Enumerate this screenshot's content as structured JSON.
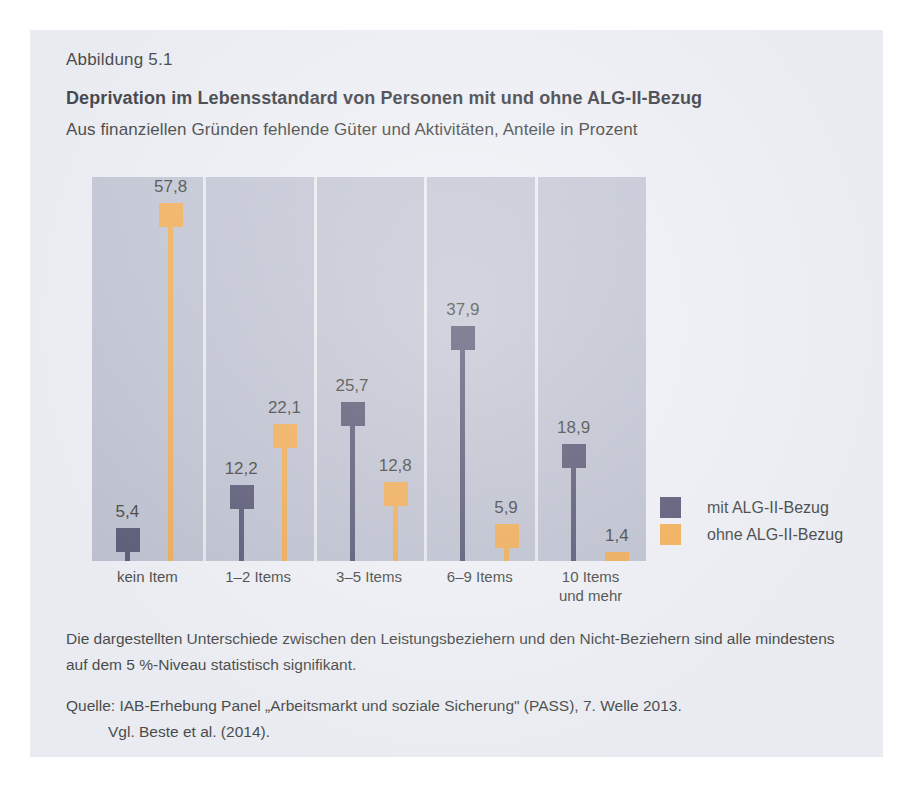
{
  "figure": {
    "number": "Abbildung 5.1",
    "title": "Deprivation im Lebensstandard von Personen mit und ohne ALG-II-Bezug",
    "subtitle": "Aus finanziellen Gründen fehlende Güter und Aktivitäten, Anteile in Prozent",
    "note": "Die dargestellten Unterschiede zwischen den Leistungsbeziehern und den Nicht-Beziehern sind alle mindestens auf dem 5 %-Niveau statistisch signifikant.",
    "source_line1": "Quelle: IAB-Erhebung Panel „Arbeitsmarkt und soziale Sicherung\" (PASS), 7. Welle 2013.",
    "source_line2": "Vgl. Beste et al. (2014)."
  },
  "colors": {
    "series_mit": "#3b3a5c",
    "series_ohne": "#f5a238",
    "plot_background": "#b9bdcd",
    "panel_background": "#eef0f5",
    "separator": "#e9ebf1"
  },
  "legend": {
    "items": [
      {
        "label": "mit ALG-II-Bezug",
        "color": "#3b3a5c",
        "swatch_name": "legend-swatch-mit"
      },
      {
        "label": "ohne ALG-II-Bezug",
        "color": "#f5a238",
        "swatch_name": "legend-swatch-ohne"
      }
    ]
  },
  "chart_data": {
    "type": "bar",
    "title": "Deprivation im Lebensstandard von Personen mit und ohne ALG-II-Bezug",
    "subtitle": "Aus finanziellen Gründen fehlende Güter und Aktivitäten, Anteile in Prozent",
    "xlabel": "",
    "ylabel": "Anteile in Prozent",
    "ylim": [
      0,
      62
    ],
    "grid": false,
    "legend_position": "right",
    "categories": [
      "kein Item",
      "1–2 Items",
      "3–5 Items",
      "6–9 Items",
      "10 Items\nund mehr"
    ],
    "series": [
      {
        "name": "mit ALG-II-Bezug",
        "color": "#3b3a5c",
        "values": [
          5.4,
          12.2,
          25.7,
          37.9,
          18.9
        ],
        "labels": [
          "5,4",
          "12,2",
          "25,7",
          "37,9",
          "18,9"
        ]
      },
      {
        "name": "ohne ALG-II-Bezug",
        "color": "#f5a238",
        "values": [
          57.8,
          22.1,
          12.8,
          5.9,
          1.4
        ],
        "labels": [
          "57,8",
          "22,1",
          "12,8",
          "5,9",
          "1,4"
        ]
      }
    ]
  }
}
